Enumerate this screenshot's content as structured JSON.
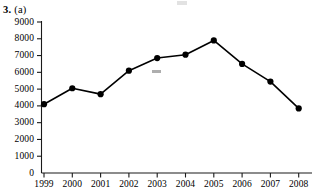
{
  "figure": {
    "number": "3.",
    "part": "(a)"
  },
  "chart_data": {
    "type": "line",
    "title": "",
    "subtitle": "",
    "xlabel": "",
    "ylabel": "",
    "categories": [
      "1999",
      "2000",
      "2001",
      "2002",
      "2003",
      "2004",
      "2005",
      "2006",
      "2007",
      "2008"
    ],
    "values": [
      4100,
      5050,
      4700,
      6100,
      6850,
      7050,
      7900,
      6500,
      5450,
      3850
    ],
    "series": [
      {
        "name": "",
        "values": [
          4100,
          5050,
          4700,
          6100,
          6850,
          7050,
          7900,
          6500,
          5450,
          3850
        ]
      }
    ],
    "ylim": [
      0,
      9000
    ],
    "ytick_labels": [
      "0",
      "1000",
      "2000",
      "3000",
      "4000",
      "5000",
      "6000",
      "7000",
      "8000",
      "9000"
    ],
    "ytick_values": [
      0,
      1000,
      2000,
      3000,
      4000,
      5000,
      6000,
      7000,
      8000,
      9000
    ],
    "xtick_labels": [
      "1999",
      "2000",
      "2001",
      "2002",
      "2003",
      "2004",
      "2005",
      "2006",
      "2007",
      "2008"
    ],
    "grid": false,
    "legend": "none",
    "marker": "filled-circle",
    "line_color": "#000000",
    "marker_color": "#000000",
    "axis_color": "#1a1a1a",
    "last_xlabel_clipped": true
  }
}
